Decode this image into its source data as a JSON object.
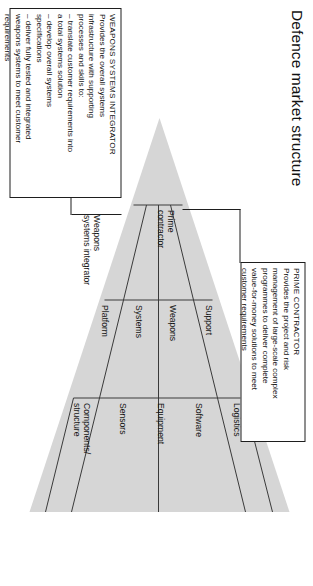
{
  "figure": {
    "title": "Defence market structure",
    "background": "#ffffff",
    "pyramid_fill": "#d6d6d6",
    "line_color": "#3a3a3a",
    "box_border": "#1e1e1e"
  },
  "callouts": [
    {
      "id": "weapons-systems-integrator",
      "heading": "WEAPONS SYSTEMS INTEGRATOR",
      "lines": [
        "Provides the overall systems",
        "infrastructure with supporting",
        "processes and skills to:",
        "– translate customer requirements into",
        "   a total systems solution",
        "– develop overall systems",
        "   specifications",
        "– deliver fully tested and integrated",
        "   weapons systems to meet customer",
        "   requirements"
      ]
    },
    {
      "id": "prime-contractor",
      "heading": "PRIME CONTRACTOR",
      "lines": [
        "Provides the project and risk",
        "management of large-scale complex",
        "programmes to deliver complete",
        "value-for-money solutions to meet",
        "customer requirements"
      ]
    }
  ],
  "pyramid": {
    "tiers": [
      {
        "id": "tier-apex",
        "label": "Prime",
        "label2": "contractor",
        "segments": [
          "Prime contractor"
        ]
      },
      {
        "id": "tier-middle",
        "label": "Weapons",
        "label2": "systems integrator",
        "segments": [
          "Platform",
          "Systems",
          "Weapons",
          "Support"
        ]
      },
      {
        "id": "tier-base",
        "label": "",
        "label2": "",
        "segments": [
          "Components/ structure",
          "Sensors",
          "Equipment",
          "Software",
          "Logistics"
        ]
      }
    ],
    "apex_label_line1": "Prime",
    "apex_label_line2": "contractor",
    "mid_label_line1": "Weapons",
    "mid_label_line2": "systems integrator",
    "row_middle": [
      "Platform",
      "Systems",
      "Weapons",
      "Support"
    ],
    "row_base_1": "Components/",
    "row_base_1b": "structure",
    "row_base_rest": [
      "Sensors",
      "Equipment",
      "Software",
      "Logistics"
    ]
  }
}
